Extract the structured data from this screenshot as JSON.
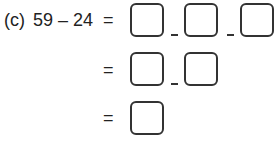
{
  "problem": {
    "label": "(c)",
    "expression": "59 – 24",
    "equals": "=",
    "rows": [
      {
        "boxes": 3,
        "separator": "–"
      },
      {
        "boxes": 2,
        "separator": "–"
      },
      {
        "boxes": 1
      }
    ]
  }
}
